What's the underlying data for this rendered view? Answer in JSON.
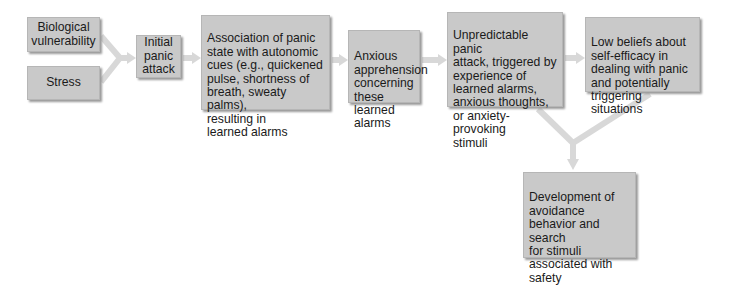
{
  "diagram": {
    "type": "flowchart",
    "colors": {
      "box_fill": "#c9c9c9",
      "box_border": "#b6b6b6",
      "box_shadow": "#9a9a9a",
      "arrow": "#d8d8d8",
      "text": "#1a1a1a",
      "background": "#ffffff"
    },
    "nodes": [
      {
        "id": "biological-vulnerability",
        "label": "Biological\nvulnerability"
      },
      {
        "id": "stress",
        "label": "Stress"
      },
      {
        "id": "initial-panic-attack",
        "label": "Initial\npanic\nattack"
      },
      {
        "id": "association",
        "label": "Association of panic\nstate with autonomic\ncues (e.g., quickened\npulse, shortness of\nbreath, sweaty palms),\nresulting in\nlearned alarms"
      },
      {
        "id": "anxious-apprehension",
        "label": "Anxious\napprehension\nconcerning\nthese learned\nalarms"
      },
      {
        "id": "unpredictable-panic-attack",
        "label": "Unpredictable panic\nattack, triggered by\nexperience of\nlearned alarms,\nanxious thoughts,\nor anxiety-provoking\nstimuli"
      },
      {
        "id": "low-self-efficacy",
        "label": "Low beliefs about\nself-efficacy in\ndealing with panic\nand potentially\ntriggering situations"
      },
      {
        "id": "avoidance-behavior",
        "label": "Development of\navoidance\nbehavior and search\nfor stimuli\nassociated with\nsafety"
      }
    ],
    "edges": [
      {
        "from": "biological-vulnerability",
        "to": "initial-panic-attack"
      },
      {
        "from": "stress",
        "to": "initial-panic-attack"
      },
      {
        "from": "initial-panic-attack",
        "to": "association"
      },
      {
        "from": "association",
        "to": "anxious-apprehension"
      },
      {
        "from": "anxious-apprehension",
        "to": "unpredictable-panic-attack"
      },
      {
        "from": "unpredictable-panic-attack",
        "to": "low-self-efficacy"
      },
      {
        "from": "unpredictable-panic-attack",
        "to": "avoidance-behavior"
      },
      {
        "from": "low-self-efficacy",
        "to": "avoidance-behavior"
      }
    ]
  }
}
